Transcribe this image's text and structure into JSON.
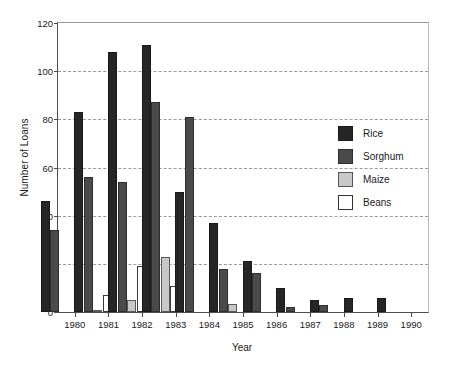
{
  "chart_data": {
    "type": "bar",
    "title": "",
    "xlabel": "Year",
    "ylabel": "Number of Loans",
    "categories": [
      "1980",
      "1981",
      "1982",
      "1983",
      "1984",
      "1985",
      "1986",
      "1987",
      "1988",
      "1989",
      "1990"
    ],
    "series": [
      {
        "name": "Rice",
        "color": "#262626",
        "values": [
          46,
          83,
          108,
          111,
          50,
          37,
          21,
          10,
          5,
          6,
          6
        ]
      },
      {
        "name": "Sorghum",
        "color": "#4a4a4a",
        "values": [
          34,
          56,
          54,
          87,
          81,
          18,
          16,
          2,
          3,
          0,
          0
        ]
      },
      {
        "name": "Maize",
        "color": "#c8c8c8",
        "values": [
          0,
          1,
          5,
          23,
          0,
          3.5,
          0,
          0,
          0,
          0,
          0
        ]
      },
      {
        "name": "Beans",
        "color": "#ffffff",
        "values": [
          0,
          7,
          19,
          11,
          0,
          0,
          0,
          0,
          0,
          0,
          0
        ]
      }
    ],
    "ylim": [
      0,
      120
    ],
    "yticks": [
      0,
      20,
      40,
      60,
      80,
      100,
      120
    ],
    "ytick_labels": [
      "0",
      "20",
      "40",
      "60",
      "80",
      "100",
      "120"
    ],
    "grid": "horizontal-dashed",
    "legend_position": "inside-right"
  },
  "axes": {
    "ylabel": "Number of Loans",
    "xlabel": "Year"
  },
  "legend": {
    "items": [
      {
        "label": "Rice",
        "swatch": "rice"
      },
      {
        "label": "Sorghum",
        "swatch": "sorghum"
      },
      {
        "label": "Maize",
        "swatch": "maize"
      },
      {
        "label": "Beans",
        "swatch": "beans"
      }
    ]
  },
  "caption": ""
}
